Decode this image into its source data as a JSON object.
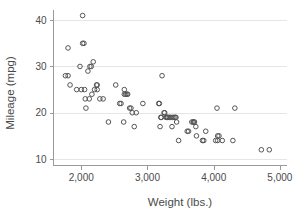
{
  "chart_data": {
    "type": "scatter",
    "title": "",
    "xlabel": "Weight (lbs.)",
    "ylabel": "Mileage (mpg)",
    "xlim": [
      1580,
      5100
    ],
    "ylim": [
      8.6,
      42.2
    ],
    "xticks": [
      2000,
      3000,
      4000,
      5000
    ],
    "xticklabels": [
      "2,000",
      "3,000",
      "4,000",
      "5,000"
    ],
    "yticks": [
      10,
      20,
      30,
      40
    ],
    "yticklabels": [
      "10",
      "20",
      "30",
      "40"
    ],
    "grid": "horizontal",
    "legend": "none",
    "marker": "open-circle",
    "marker_color": "#555555",
    "grid_color": "#e6e6e6",
    "axis_color": "#9a9a9a",
    "background": "#ffffff",
    "series": [
      {
        "name": "Mileage vs Weight",
        "points": [
          [
            1760,
            28
          ],
          [
            1800,
            34
          ],
          [
            1800,
            28
          ],
          [
            1830,
            26
          ],
          [
            1930,
            25
          ],
          [
            1980,
            30
          ],
          [
            2000,
            25
          ],
          [
            2020,
            41
          ],
          [
            2020,
            35
          ],
          [
            2040,
            35
          ],
          [
            2050,
            25
          ],
          [
            2060,
            23
          ],
          [
            2070,
            21
          ],
          [
            2100,
            29
          ],
          [
            2120,
            23
          ],
          [
            2130,
            30
          ],
          [
            2150,
            30
          ],
          [
            2160,
            24
          ],
          [
            2180,
            31
          ],
          [
            2200,
            25
          ],
          [
            2230,
            26
          ],
          [
            2240,
            26
          ],
          [
            2240,
            25
          ],
          [
            2280,
            23
          ],
          [
            2330,
            23
          ],
          [
            2410,
            18
          ],
          [
            2520,
            26
          ],
          [
            2580,
            22
          ],
          [
            2600,
            22
          ],
          [
            2640,
            18
          ],
          [
            2650,
            25
          ],
          [
            2650,
            24
          ],
          [
            2670,
            24
          ],
          [
            2690,
            24
          ],
          [
            2700,
            24
          ],
          [
            2730,
            21
          ],
          [
            2750,
            21
          ],
          [
            2770,
            20
          ],
          [
            2800,
            17
          ],
          [
            2830,
            20
          ],
          [
            2930,
            22
          ],
          [
            3170,
            22
          ],
          [
            3180,
            22
          ],
          [
            3190,
            17
          ],
          [
            3200,
            19
          ],
          [
            3210,
            19
          ],
          [
            3220,
            28
          ],
          [
            3250,
            20
          ],
          [
            3260,
            20
          ],
          [
            3280,
            19
          ],
          [
            3290,
            19
          ],
          [
            3300,
            19
          ],
          [
            3310,
            19
          ],
          [
            3330,
            19
          ],
          [
            3350,
            19
          ],
          [
            3370,
            17
          ],
          [
            3380,
            19
          ],
          [
            3400,
            19
          ],
          [
            3420,
            19
          ],
          [
            3430,
            19
          ],
          [
            3440,
            18
          ],
          [
            3470,
            14
          ],
          [
            3600,
            16
          ],
          [
            3620,
            16
          ],
          [
            3670,
            18
          ],
          [
            3690,
            18
          ],
          [
            3700,
            18
          ],
          [
            3710,
            18
          ],
          [
            3730,
            17
          ],
          [
            3740,
            15
          ],
          [
            3830,
            14
          ],
          [
            3850,
            14
          ],
          [
            3880,
            16
          ],
          [
            4030,
            14
          ],
          [
            4050,
            21
          ],
          [
            4060,
            15
          ],
          [
            4060,
            14
          ],
          [
            4080,
            15
          ],
          [
            4130,
            14
          ],
          [
            4290,
            14
          ],
          [
            4320,
            21
          ],
          [
            4720,
            12
          ],
          [
            4840,
            12
          ]
        ]
      }
    ]
  }
}
